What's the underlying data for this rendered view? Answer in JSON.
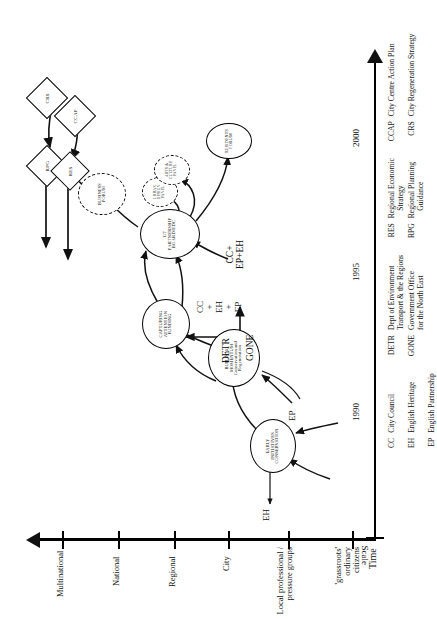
{
  "figure": {
    "time_axis": {
      "label": "Time",
      "ticks": [
        "1990",
        "1995",
        "2000"
      ],
      "arrow": "right"
    },
    "scale_axis": {
      "label": "Scale",
      "levels": [
        "Multinational",
        "National",
        "Regional",
        "City",
        "Local professional /\npressure groups",
        "'grassroots'\nordinary\ncitizens"
      ],
      "arrow": "up"
    },
    "phases": [
      {
        "id": "early",
        "title": "EARLY",
        "line2": "INITIATIVES",
        "line3": "CONSERVATION"
      },
      {
        "id": "building",
        "title": "BUILDING",
        "line2": "MOMENTUM",
        "line3": "Conservation and",
        "line4": "Regeneration"
      },
      {
        "id": "capturing",
        "title": "CAPTURING",
        "line2": "ATTENTION",
        "line3": "FUNDING"
      },
      {
        "id": "partnership",
        "title": "GT",
        "line2": "PARTNERSHIP",
        "line3": "BOARD/EDC"
      }
    ],
    "forums": [
      {
        "id": "business-forum",
        "line1": "BUSINESS",
        "line2": "FORUM",
        "style": "dashed"
      },
      {
        "id": "urban-design-panel",
        "line1": "URBAN",
        "line2": "DESIGN",
        "line3": "PANEL",
        "style": "dashed"
      },
      {
        "id": "arts-culture-panel",
        "line1": "ARTS &",
        "line2": "CULTURE",
        "line3": "PANEL",
        "style": "dashed"
      },
      {
        "id": "residents-forum",
        "line1": "RESIDENTS",
        "line2": "FORUM",
        "style": "solid"
      }
    ],
    "policy_documents": [
      {
        "id": "rpg",
        "label": "RPG"
      },
      {
        "id": "res",
        "label": "RES"
      },
      {
        "id": "ccap",
        "label": "CCAP"
      },
      {
        "id": "crs",
        "label": "CRS"
      }
    ],
    "actor_labels": [
      {
        "id": "eh-left",
        "text": "EH"
      },
      {
        "id": "ep-left",
        "text": "EP"
      },
      {
        "id": "gone",
        "text": "GONE"
      },
      {
        "id": "detr",
        "text": "DETR"
      },
      {
        "id": "cc-eh-ep",
        "text": "CC\n+\nEH\n+\nEP"
      },
      {
        "id": "cc-ep-eh",
        "text": "CC+\nEP+EH"
      }
    ],
    "legend": {
      "column1": [
        {
          "abbr": "CC",
          "full": "City Council"
        },
        {
          "abbr": "EH",
          "full": "English Heritage"
        },
        {
          "abbr": "EP",
          "full": "English Partnership"
        }
      ],
      "column2": [
        {
          "abbr": "DETR",
          "full": "Dept of Environment\nTransport & the Regions"
        },
        {
          "abbr": "GONE",
          "full": "Government Office\nfor the North East"
        }
      ],
      "column3": [
        {
          "abbr": "RES",
          "full": "Regional Economic\n    Strategy"
        },
        {
          "abbr": "RPG",
          "full": "Regional Planning\n    Guidance"
        }
      ],
      "column4": [
        {
          "abbr": "CCAP",
          "full": "City Centre Action Plan"
        },
        {
          "abbr": "CRS",
          "full": "City Regeneration Strategy"
        }
      ]
    },
    "colors": {
      "ink": "#111111",
      "line": "#000000",
      "background": "#ffffff"
    }
  }
}
